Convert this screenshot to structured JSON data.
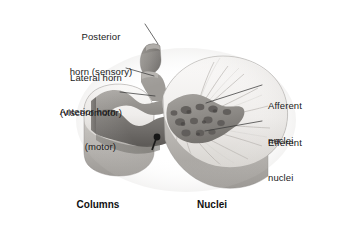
{
  "figure": {
    "background_color": "#ffffff",
    "ink_color": "#1a1a1a",
    "leader_line_color": "#3a3a3a",
    "palette": {
      "white_matter_light": "#f2f1ef",
      "white_matter_mid": "#dedcd9",
      "white_matter_shadow": "#bdbab6",
      "gray_matter_light": "#b3b0ac",
      "gray_matter_mid": "#8e8b87",
      "gray_matter_dark": "#6e6b68",
      "gray_matter_deep": "#565350",
      "nuclei_dot": "#6a6764",
      "nuclei_dot_dark": "#4e4b49",
      "pin_dark": "#1b1b1b",
      "edge_line": "#8a8784"
    }
  },
  "labels": {
    "posterior_horn": {
      "line1": "Posterior",
      "line2": "horn (sensory)"
    },
    "lateral_horn": {
      "line1": "Lateral horn",
      "line2": "(visceromotor)"
    },
    "anterior_horn": {
      "line1": "Anterior horn",
      "line2": "(motor)"
    },
    "afferent_nuclei": {
      "line1": "Afferent",
      "line2": "nuclei"
    },
    "efferent_nuclei": {
      "line1": "Efferent",
      "line2": "nuclei"
    }
  },
  "captions": {
    "columns": "Columns",
    "nuclei": "Nuclei"
  },
  "icons": {
    "leader_posterior": "leader-line-icon",
    "leader_lateral": "leader-line-icon",
    "leader_anterior": "leader-line-icon",
    "leader_afferent": "leader-line-icon",
    "leader_efferent": "leader-line-icon",
    "specimen": "spinal-cord-specimen-icon"
  }
}
